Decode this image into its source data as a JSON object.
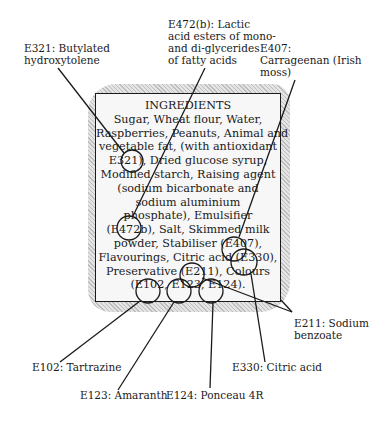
{
  "ingredients_panel": {
    "title": "INGREDIENTS",
    "lines": [
      "Sugar, Wheat flour, Water,",
      "Raspberries, Peanuts, Animal and",
      "vegetable fat, (with antioxidant",
      "E321), Dried glucose syrup,",
      "Modified starch, Raising agent",
      "(sodium bicarbonate and",
      "sodium aluminium",
      "phosphate), Emulsifier",
      "(E472b), Salt, Skimmed milk",
      "powder, Stabiliser (E407),",
      "Flavourings, Citric acid (E330),",
      "Preservative (E211), Colours",
      "(E102, E123, E124)."
    ]
  },
  "callouts": {
    "e321": {
      "line1": "E321: Butylated",
      "line2": "hydroxytolene"
    },
    "e472b": {
      "line1": "E472(b): Lactic",
      "line2": "acid esters of mono-",
      "line3": "and di-glycerides",
      "line4": "of fatty acids"
    },
    "e407": {
      "line1": "E407:",
      "line2": "Carrageenan (Irish",
      "line3": "moss)"
    },
    "e211": {
      "line1": "E211: Sodium",
      "line2": "benzoate"
    },
    "e102": {
      "line1": "E102: Tartrazine"
    },
    "e330": {
      "line1": "E330: Citric acid"
    },
    "e123": {
      "line1": "E123: Amaranth"
    },
    "e124": {
      "line1": "E124: Ponceau 4R"
    }
  }
}
